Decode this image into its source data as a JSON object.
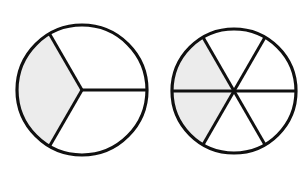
{
  "page": {
    "background_color": "#ffffff",
    "width": 307,
    "height": 171
  },
  "style": {
    "shaded_fill": "#ececec",
    "unshaded_fill": "#ffffff",
    "stroke_color": "#101010",
    "outline_width": 3.2,
    "divider_width": 3.0
  },
  "figures": [
    {
      "id": "left-circle",
      "name": "circle-thirds",
      "label": "Circle divided into thirds with one third shaded",
      "center_x": 82,
      "center_y": 90,
      "radius": 65,
      "total_parts": 3,
      "shaded_parts": 1,
      "fraction": "1/3",
      "sector_angle_degrees": 120,
      "divider_angles_degrees": [
        0,
        120,
        240
      ],
      "sectors": [
        {
          "index": 0,
          "start_deg": 0,
          "end_deg": 120,
          "shaded": false
        },
        {
          "index": 1,
          "start_deg": 120,
          "end_deg": 240,
          "shaded": true
        },
        {
          "index": 2,
          "start_deg": 240,
          "end_deg": 360,
          "shaded": false
        }
      ]
    },
    {
      "id": "right-circle",
      "name": "circle-sixths",
      "label": "Circle divided into sixths with two sixths shaded",
      "center_x": 234,
      "center_y": 91,
      "radius": 62,
      "total_parts": 6,
      "shaded_parts": 2,
      "fraction": "2/6",
      "sector_angle_degrees": 60,
      "divider_angles_degrees": [
        0,
        60,
        120,
        180,
        240,
        300
      ],
      "sectors": [
        {
          "index": 0,
          "start_deg": 0,
          "end_deg": 60,
          "shaded": false
        },
        {
          "index": 1,
          "start_deg": 60,
          "end_deg": 120,
          "shaded": false
        },
        {
          "index": 2,
          "start_deg": 120,
          "end_deg": 180,
          "shaded": true
        },
        {
          "index": 3,
          "start_deg": 180,
          "end_deg": 240,
          "shaded": true
        },
        {
          "index": 4,
          "start_deg": 240,
          "end_deg": 300,
          "shaded": false
        },
        {
          "index": 5,
          "start_deg": 300,
          "end_deg": 360,
          "shaded": false
        }
      ]
    }
  ]
}
